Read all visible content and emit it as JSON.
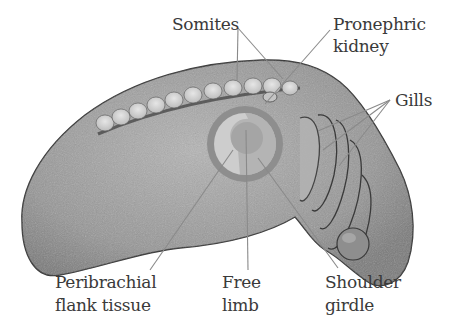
{
  "figure": {
    "colors": {
      "embryo_fill": "#9a9a9a",
      "embryo_outline": "#3a3a3a",
      "somite_fill": "#d6d6d6",
      "ring_outer": "#8c8c8c",
      "ring_inner": "#c8c8c8",
      "limb_center": "#a8a8a8",
      "leader_line": "#8a8a8a",
      "label_text": "#3a3a3a"
    }
  },
  "labels": {
    "somites": "Somites",
    "pronephric_line1": "Pronephric",
    "pronephric_line2": "kidney",
    "gills": "Gills",
    "peribrachial_line1": "Peribrachial",
    "peribrachial_line2": "flank tissue",
    "free_line1": "Free",
    "free_line2": "limb",
    "shoulder_line1": "Shoulder",
    "shoulder_line2": "girdle"
  }
}
